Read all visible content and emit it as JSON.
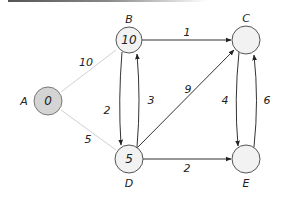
{
  "diagram": {
    "type": "weighted-directed-graph",
    "nodes": [
      {
        "id": "A",
        "label": "A",
        "value": "0",
        "cx": 48,
        "cy": 101,
        "fill": "#d4d4d4",
        "stroke": "#777777"
      },
      {
        "id": "B",
        "label": "B",
        "value": "10",
        "cx": 129,
        "cy": 40,
        "fill": "#f2f2f2",
        "stroke": "#555555"
      },
      {
        "id": "C",
        "label": "C",
        "value": "",
        "cx": 246,
        "cy": 40,
        "fill": "#f2f2f2",
        "stroke": "#555555"
      },
      {
        "id": "D",
        "label": "D",
        "value": "5",
        "cx": 129,
        "cy": 159,
        "fill": "#f2f2f2",
        "stroke": "#555555"
      },
      {
        "id": "E",
        "label": "E",
        "value": "",
        "cx": 246,
        "cy": 159,
        "fill": "#f2f2f2",
        "stroke": "#555555"
      }
    ],
    "edges": [
      {
        "from": "A",
        "to": "B",
        "weight": "10",
        "style": "faded"
      },
      {
        "from": "A",
        "to": "D",
        "weight": "5",
        "style": "faded"
      },
      {
        "from": "B",
        "to": "C",
        "weight": "1",
        "style": "normal"
      },
      {
        "from": "B",
        "to": "D",
        "weight": "2",
        "style": "normal"
      },
      {
        "from": "D",
        "to": "B",
        "weight": "3",
        "style": "normal"
      },
      {
        "from": "D",
        "to": "C",
        "weight": "9",
        "style": "normal"
      },
      {
        "from": "D",
        "to": "E",
        "weight": "2",
        "style": "normal"
      },
      {
        "from": "C",
        "to": "E",
        "weight": "4",
        "style": "normal"
      },
      {
        "from": "E",
        "to": "C",
        "weight": "6",
        "style": "normal"
      }
    ],
    "labels": {
      "node_A": "A",
      "node_B": "B",
      "node_C": "C",
      "node_D": "D",
      "node_E": "E",
      "val_A": "0",
      "val_B": "10",
      "val_D": "5",
      "w_AB": "10",
      "w_AD": "5",
      "w_BC": "1",
      "w_BD": "2",
      "w_DB": "3",
      "w_DC": "9",
      "w_DE": "2",
      "w_CE": "4",
      "w_EC": "6"
    },
    "colors": {
      "edge": "#333333",
      "edge_faded": "#cfcfcf",
      "node_fill": "#f2f2f2",
      "source_fill": "#d4d4d4"
    }
  }
}
